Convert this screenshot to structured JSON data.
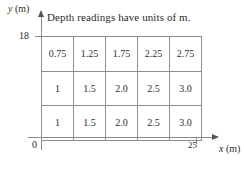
{
  "figure": {
    "title": "Depth readings have units of m.",
    "axes": {
      "y_label": "y",
      "y_unit": "(m)",
      "x_label": "x",
      "x_unit": "(m)",
      "origin_label": "0",
      "y_max_tick": "18",
      "x_max_tick": "25"
    }
  },
  "chart_data": {
    "type": "heatmap",
    "title": "Depth readings have units of m.",
    "xlabel": "x (m)",
    "ylabel": "y (m)",
    "xlim": [
      0,
      25
    ],
    "ylim": [
      0,
      18
    ],
    "grid": true,
    "legend": "none",
    "columns": 5,
    "rows": 3,
    "cell_width_m": 5,
    "cell_height_m": 6,
    "row_order": "top-to-bottom",
    "values": [
      [
        "0.75",
        "1.25",
        "1.75",
        "2.25",
        "2.75"
      ],
      [
        "1",
        "1.5",
        "2.0",
        "2.5",
        "3.0"
      ],
      [
        "1",
        "1.5",
        "2.0",
        "2.5",
        "3.0"
      ]
    ],
    "annotations": [
      "Depth readings have units of m."
    ]
  }
}
